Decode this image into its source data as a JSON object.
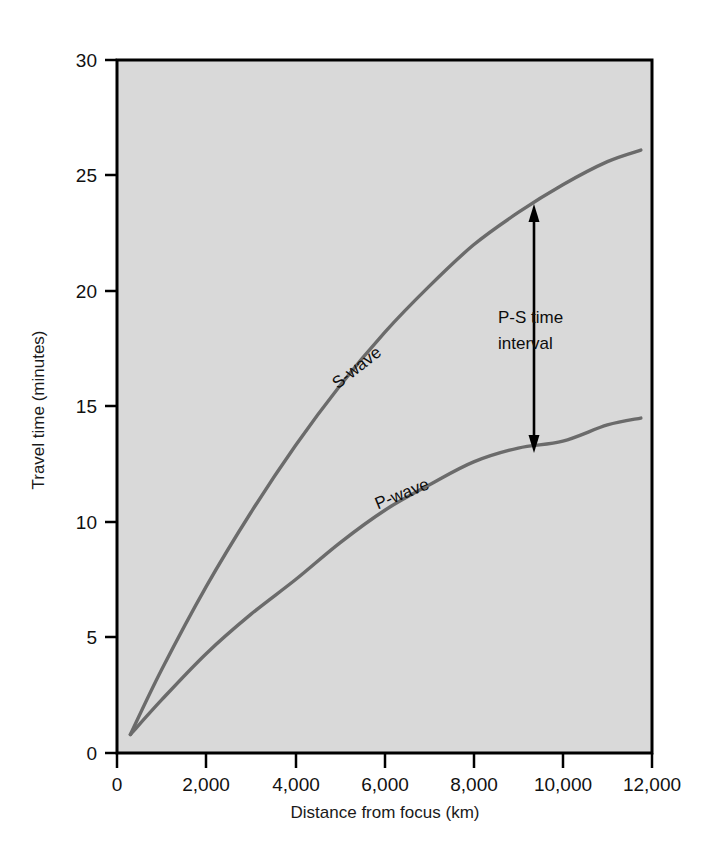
{
  "chart_data": {
    "type": "line",
    "title": "",
    "subtitle": "",
    "xlabel": "Distance from focus (km)",
    "ylabel": "Travel time (minutes)",
    "xlim": [
      0,
      12000
    ],
    "ylim": [
      0,
      30
    ],
    "grid": false,
    "legend_position": "inline-curve-labels",
    "plot_background": "#d9d9d9",
    "curve_color": "#6b6b6b",
    "frame_color": "#000000",
    "x_ticks": [
      0,
      2000,
      4000,
      6000,
      8000,
      10000,
      12000
    ],
    "x_tick_labels": [
      "0",
      "2,000",
      "4,000",
      "6,000",
      "8,000",
      "10,000",
      "12,000"
    ],
    "y_ticks": [
      0,
      5,
      10,
      15,
      20,
      25,
      30
    ],
    "y_tick_labels": [
      "0",
      "5",
      "10",
      "15",
      "20",
      "25",
      "30"
    ],
    "series": [
      {
        "name": "S-wave",
        "label": "S-wave",
        "label_rotation": -38,
        "x": [
          300,
          1000,
          2000,
          3000,
          4000,
          5000,
          6000,
          7000,
          8000,
          9000,
          10000,
          11000,
          11750
        ],
        "values": [
          0.8,
          3.6,
          7.2,
          10.4,
          13.3,
          15.9,
          18.2,
          20.2,
          22.0,
          23.4,
          24.6,
          25.6,
          26.1
        ]
      },
      {
        "name": "P-wave",
        "label": "P-wave",
        "label_rotation": -22,
        "x": [
          300,
          1000,
          2000,
          3000,
          4000,
          5000,
          6000,
          7000,
          8000,
          9000,
          10000,
          11000,
          11750
        ],
        "values": [
          0.8,
          2.3,
          4.3,
          6.0,
          7.5,
          9.1,
          10.5,
          11.6,
          12.6,
          13.2,
          13.5,
          14.2,
          14.5
        ]
      }
    ],
    "annotations": [
      {
        "name": "p-s-time-interval",
        "text_lines": [
          "P-S time",
          "interval"
        ],
        "arrow": "double-headed-vertical",
        "at_x": 9350,
        "from_y": 13.2,
        "to_y": 23.4
      }
    ]
  }
}
